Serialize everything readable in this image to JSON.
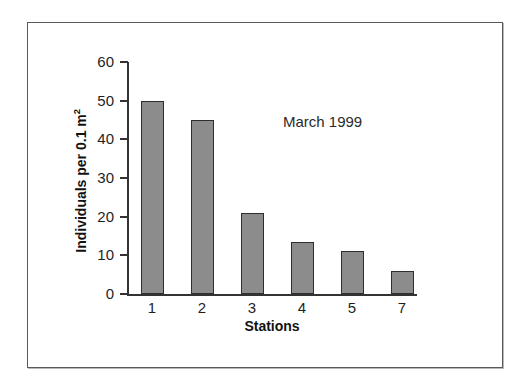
{
  "figure": {
    "annotation": "March 1999",
    "frame_color": "#5a5a5a",
    "background": "#ffffff"
  },
  "chart_data": {
    "type": "bar",
    "title": "",
    "annotation": "March 1999",
    "categories": [
      "1",
      "2",
      "3",
      "4",
      "5",
      "7"
    ],
    "values": [
      49.8,
      45,
      21,
      13.5,
      11,
      6
    ],
    "xlabel": "Stations",
    "ylabel": "Individuals per 0.1 m",
    "ylabel_superscript": "2",
    "ylim": [
      0,
      60
    ],
    "yticks": [
      0,
      10,
      20,
      30,
      40,
      50,
      60
    ],
    "ytick_labels": [
      "0",
      "10",
      "20",
      "30",
      "40",
      "50",
      "60"
    ],
    "grid": false,
    "legend": false,
    "bar_fill_color": "#8c8c8c",
    "bar_edge_color": "#2e2e2e",
    "axis_color": "#333333"
  }
}
